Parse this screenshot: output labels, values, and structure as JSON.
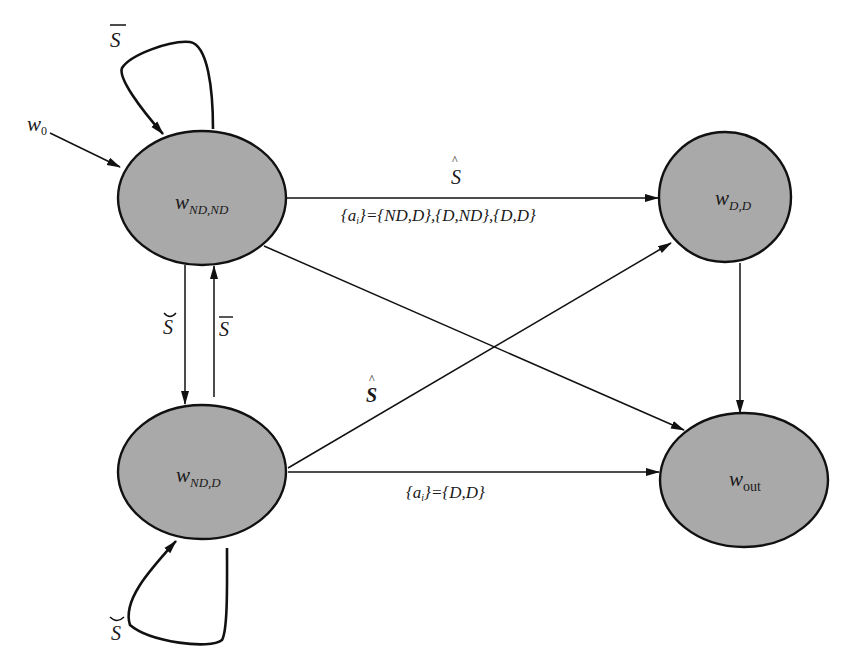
{
  "diagram": {
    "type": "state-transition",
    "fill_color": "#a9a9a9",
    "stroke_color": "#111111",
    "initial": {
      "base": "w",
      "sub": "0"
    },
    "nodes": [
      {
        "id": "nd_nd",
        "base": "w",
        "sub": "ND,ND"
      },
      {
        "id": "d_d",
        "base": "w",
        "sub": "D,D"
      },
      {
        "id": "nd_d",
        "base": "w",
        "sub": "ND,D"
      },
      {
        "id": "out",
        "base": "w",
        "sub": "out"
      }
    ],
    "edges": [
      {
        "from": "w0",
        "to": "nd_nd",
        "label": ""
      },
      {
        "from": "nd_nd",
        "to": "nd_nd",
        "label": "S̄ (S bar)"
      },
      {
        "from": "nd_nd",
        "to": "d_d",
        "label": "Ŝ (S hat)",
        "sublabel": "{a_i}={ND,D},{D,ND},{D,D}"
      },
      {
        "from": "nd_nd",
        "to": "nd_d",
        "label": "S̆ (S breve)"
      },
      {
        "from": "nd_d",
        "to": "nd_nd",
        "label": "S̄ (S bar)"
      },
      {
        "from": "nd_nd",
        "to": "out",
        "label": ""
      },
      {
        "from": "nd_d",
        "to": "d_d",
        "label": "Ŝ (S hat, bold)"
      },
      {
        "from": "nd_d",
        "to": "out",
        "label": "",
        "sublabel": "{a_i}={D,D}"
      },
      {
        "from": "d_d",
        "to": "out",
        "label": ""
      },
      {
        "from": "nd_d",
        "to": "nd_d",
        "label": "S̆ (S breve)"
      }
    ]
  },
  "labels": {
    "S": "S",
    "w": "w",
    "w0_sub": "0",
    "nd_nd_sub": "ND,ND",
    "d_d_sub": "D,D",
    "nd_d_sub": "ND,D",
    "out_sub": "out",
    "top_edge_set_prefix": "{a",
    "top_edge_set_i": "i",
    "top_edge_set_rest": "}={ND,D},{D,ND},{D,D}",
    "bottom_edge_set_prefix": "{a",
    "bottom_edge_set_i": "i",
    "bottom_edge_set_rest": "}={D,D}"
  }
}
